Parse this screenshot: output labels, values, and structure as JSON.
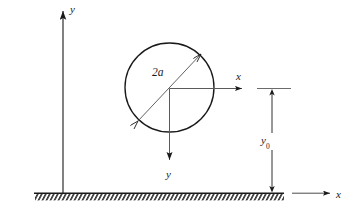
{
  "figure": {
    "type": "technical-line-diagram",
    "background_color": "#ffffff",
    "line_color": "#1a1a1a"
  },
  "labels": {
    "global_y_axis": "y",
    "global_x_axis": "x",
    "local_x_axis": "x",
    "local_y_axis": "y",
    "diameter": "2a",
    "height_symbol": "y",
    "height_subscript": "0"
  },
  "geometry": {
    "circle": {
      "cx": 169.5,
      "cy": 87.5,
      "r": 44.5
    },
    "global_y_axis": {
      "x": 63,
      "y_top": 6,
      "y_bottom": 193
    },
    "global_x_axis": {
      "y": 193,
      "x_start": 292,
      "x_end": 333
    },
    "local_x_axis": {
      "x_start": 169.5,
      "x_end": 245,
      "y": 88.5
    },
    "local_y_axis": {
      "x": 169.5,
      "y_start": 88.5,
      "y_end": 165
    },
    "dimension_line": {
      "x": 272,
      "y_top": 89,
      "y_bottom": 192
    },
    "extension_line": {
      "y": 88.5,
      "x_start": 258,
      "x_end": 290
    },
    "ground": {
      "y": 193,
      "x_start": 35,
      "x_end": 284,
      "hatch_depth": 7
    },
    "diameter_arrow": {
      "x1": 138,
      "y1": 121,
      "x2": 201,
      "y2": 54
    }
  }
}
